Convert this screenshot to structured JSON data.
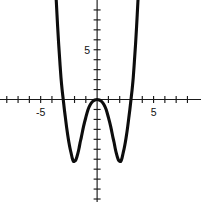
{
  "chart_data": {
    "type": "line",
    "title": "",
    "subtitle": "",
    "xlabel": "",
    "ylabel": "",
    "xlim": [
      -8.6,
      9.2
    ],
    "ylim": [
      -10.3,
      10.0
    ],
    "grid": false,
    "legend": null,
    "axes": {
      "x_axis_label_values": [
        "-5",
        "5"
      ],
      "y_axis_label_values": [
        "5"
      ],
      "x_tick_step": 1,
      "y_tick_step": 1,
      "x_ticks": [
        -8,
        -7,
        -6,
        -5,
        -4,
        -3,
        -2,
        -1,
        1,
        2,
        3,
        4,
        5,
        6,
        7,
        8
      ],
      "y_ticks": [
        -10,
        -9,
        -8,
        -7,
        -6,
        -5,
        -4,
        -3,
        -2,
        -1,
        1,
        2,
        3,
        4,
        5,
        6,
        7,
        8,
        9
      ],
      "x_labeled_ticks": [
        {
          "value": -5,
          "text": "-5"
        },
        {
          "value": 5,
          "text": "5"
        }
      ],
      "y_labeled_ticks": [
        {
          "value": 5,
          "text": "5"
        }
      ]
    },
    "curve": {
      "name": "quartic",
      "description": "W-shaped quartic with double root at origin",
      "roots": [
        -3.0,
        0.0,
        0.0,
        3.0
      ],
      "local_minima": [
        {
          "x": -2.1,
          "y": -6.2
        },
        {
          "x": 2.1,
          "y": -6.2
        }
      ],
      "local_maxima": [
        {
          "x": 0.0,
          "y": 0.0
        }
      ],
      "points": [
        {
          "x": -3.62,
          "y": 10.0
        },
        {
          "x": -3.5,
          "y": 7.4
        },
        {
          "x": -3.4,
          "y": 5.5
        },
        {
          "x": -3.3,
          "y": 3.8
        },
        {
          "x": -3.2,
          "y": 2.2
        },
        {
          "x": -3.1,
          "y": 1.0
        },
        {
          "x": -3.0,
          "y": 0.0
        },
        {
          "x": -2.9,
          "y": -1.0
        },
        {
          "x": -2.8,
          "y": -1.9
        },
        {
          "x": -2.7,
          "y": -2.8
        },
        {
          "x": -2.6,
          "y": -3.6
        },
        {
          "x": -2.5,
          "y": -4.3
        },
        {
          "x": -2.4,
          "y": -4.9
        },
        {
          "x": -2.3,
          "y": -5.4
        },
        {
          "x": -2.2,
          "y": -5.9
        },
        {
          "x": -2.1,
          "y": -6.2
        },
        {
          "x": -2.0,
          "y": -6.2
        },
        {
          "x": -1.9,
          "y": -6.1
        },
        {
          "x": -1.8,
          "y": -5.8
        },
        {
          "x": -1.7,
          "y": -5.4
        },
        {
          "x": -1.6,
          "y": -4.9
        },
        {
          "x": -1.5,
          "y": -4.3
        },
        {
          "x": -1.4,
          "y": -3.8
        },
        {
          "x": -1.2,
          "y": -2.7
        },
        {
          "x": -1.0,
          "y": -1.8
        },
        {
          "x": -0.8,
          "y": -1.0
        },
        {
          "x": -0.6,
          "y": -0.5
        },
        {
          "x": -0.4,
          "y": -0.2
        },
        {
          "x": -0.2,
          "y": -0.05
        },
        {
          "x": 0.0,
          "y": 0.0
        },
        {
          "x": 0.2,
          "y": -0.05
        },
        {
          "x": 0.4,
          "y": -0.2
        },
        {
          "x": 0.6,
          "y": -0.5
        },
        {
          "x": 0.8,
          "y": -1.0
        },
        {
          "x": 1.0,
          "y": -1.8
        },
        {
          "x": 1.2,
          "y": -2.7
        },
        {
          "x": 1.4,
          "y": -3.8
        },
        {
          "x": 1.5,
          "y": -4.3
        },
        {
          "x": 1.6,
          "y": -4.9
        },
        {
          "x": 1.7,
          "y": -5.4
        },
        {
          "x": 1.8,
          "y": -5.8
        },
        {
          "x": 1.9,
          "y": -6.1
        },
        {
          "x": 2.0,
          "y": -6.2
        },
        {
          "x": 2.1,
          "y": -6.2
        },
        {
          "x": 2.2,
          "y": -5.9
        },
        {
          "x": 2.3,
          "y": -5.4
        },
        {
          "x": 2.4,
          "y": -4.9
        },
        {
          "x": 2.5,
          "y": -4.3
        },
        {
          "x": 2.6,
          "y": -3.6
        },
        {
          "x": 2.7,
          "y": -2.8
        },
        {
          "x": 2.8,
          "y": -1.9
        },
        {
          "x": 2.9,
          "y": -1.0
        },
        {
          "x": 3.0,
          "y": 0.0
        },
        {
          "x": 3.1,
          "y": 1.0
        },
        {
          "x": 3.2,
          "y": 2.2
        },
        {
          "x": 3.3,
          "y": 3.8
        },
        {
          "x": 3.4,
          "y": 5.5
        },
        {
          "x": 3.5,
          "y": 7.4
        },
        {
          "x": 3.62,
          "y": 10.0
        }
      ]
    },
    "colors": {
      "curve": "#0d0d0d",
      "axis": "#1a1a1a",
      "background": "#ffffff",
      "label": "#111111"
    }
  }
}
